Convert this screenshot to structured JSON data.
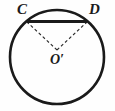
{
  "figure": {
    "kind": "circle-with-chord-and-radii",
    "background_color": "#fefefe",
    "stroke_color": "#1a1a1a",
    "labels": {
      "point_c": "C",
      "point_d": "D",
      "center": "O′"
    },
    "circle": {
      "center_x": 57,
      "center_y": 57,
      "radius": 47,
      "stroke_width": 2.6
    },
    "chord": {
      "name": "CD",
      "x1": 27,
      "y1": 21.5,
      "x2": 87,
      "y2": 21.5,
      "stroke_width": 3.2,
      "style": "solid"
    },
    "radii": [
      {
        "name": "O'C",
        "x1": 57,
        "y1": 50,
        "x2": 27.5,
        "y2": 22.5,
        "style": "dashed",
        "stroke_width": 1.1,
        "dash_pattern": "3 2.5"
      },
      {
        "name": "O'D",
        "x1": 57,
        "y1": 50,
        "x2": 86.5,
        "y2": 22.5,
        "style": "dashed",
        "stroke_width": 1.1,
        "dash_pattern": "3 2.5"
      }
    ]
  }
}
